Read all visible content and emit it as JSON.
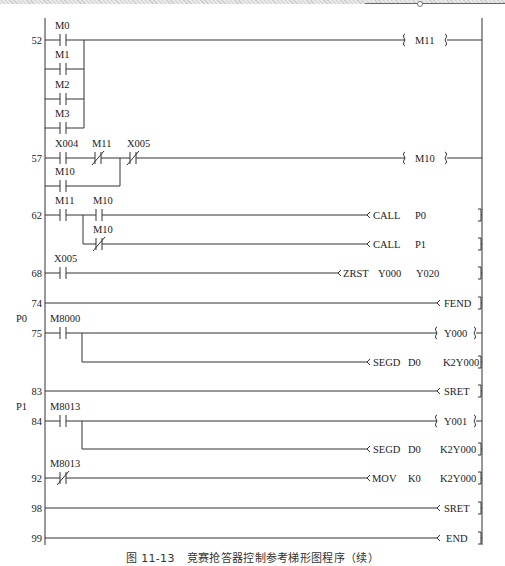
{
  "figure": {
    "caption_number": "图 11-13",
    "caption_title": "竞赛抢答器控制参考梯形图程序（续）"
  },
  "rungs": [
    {
      "step": "52",
      "contacts": [
        {
          "name": "M0",
          "type": "NO"
        },
        {
          "name": "M1",
          "type": "NO",
          "parallel": true
        },
        {
          "name": "M2",
          "type": "NO",
          "parallel": true
        },
        {
          "name": "M3",
          "type": "NO",
          "parallel": true
        }
      ],
      "output": {
        "kind": "coil",
        "text": "M11"
      }
    },
    {
      "step": "57",
      "contacts": [
        {
          "name": "X004",
          "type": "NO"
        },
        {
          "name": "M11",
          "type": "NC"
        },
        {
          "name": "X005",
          "type": "NC"
        },
        {
          "name": "M10",
          "type": "NO",
          "parallel": true
        }
      ],
      "output": {
        "kind": "coil",
        "text": "M10"
      }
    },
    {
      "step": "62",
      "contacts": [
        {
          "name": "M11",
          "type": "NO"
        },
        {
          "name": "M10",
          "type": "NO"
        },
        {
          "name": "M10",
          "type": "NC",
          "branch": true
        }
      ],
      "outputs": [
        {
          "kind": "instr",
          "op": "CALL",
          "args": [
            "P0"
          ]
        },
        {
          "kind": "instr",
          "op": "CALL",
          "args": [
            "P1"
          ]
        }
      ]
    },
    {
      "step": "68",
      "contacts": [
        {
          "name": "X005",
          "type": "NO"
        }
      ],
      "output": {
        "kind": "instr",
        "op": "ZRST",
        "args": [
          "Y000",
          "Y020"
        ]
      }
    },
    {
      "step": "74",
      "contacts": [],
      "output": {
        "kind": "instr",
        "op": "FEND",
        "args": []
      }
    },
    {
      "step": "75",
      "pointer": "P0",
      "contacts": [
        {
          "name": "M8000",
          "type": "NO"
        }
      ],
      "outputs": [
        {
          "kind": "coil",
          "text": "Y000"
        },
        {
          "kind": "instr",
          "op": "SEGD",
          "args": [
            "D0",
            "K2Y000"
          ]
        }
      ]
    },
    {
      "step": "83",
      "contacts": [],
      "output": {
        "kind": "instr",
        "op": "SRET",
        "args": []
      }
    },
    {
      "step": "84",
      "pointer": "P1",
      "contacts": [
        {
          "name": "M8013",
          "type": "NO"
        }
      ],
      "outputs": [
        {
          "kind": "coil",
          "text": "Y001"
        },
        {
          "kind": "instr",
          "op": "SEGD",
          "args": [
            "D0",
            "K2Y000"
          ]
        }
      ]
    },
    {
      "step": "92",
      "contacts": [
        {
          "name": "M8013",
          "type": "NC"
        }
      ],
      "output": {
        "kind": "instr",
        "op": "MOV",
        "args": [
          "K0",
          "K2Y000"
        ]
      }
    },
    {
      "step": "98",
      "contacts": [],
      "output": {
        "kind": "instr",
        "op": "SRET",
        "args": []
      }
    },
    {
      "step": "99",
      "contacts": [],
      "output": {
        "kind": "instr",
        "op": "END",
        "args": []
      }
    }
  ],
  "labels": {
    "s52": "52",
    "s57": "57",
    "s62": "62",
    "s68": "68",
    "s74": "74",
    "s75": "75",
    "s83": "83",
    "s84": "84",
    "s92": "92",
    "s98": "98",
    "s99": "99",
    "p0": "P0",
    "p1": "P1",
    "c_m0": "M0",
    "c_m1": "M1",
    "c_m2": "M2",
    "c_m3": "M3",
    "c_x004": "X004",
    "c_m11a": "M11",
    "c_x005a": "X005",
    "c_m10a": "M10",
    "c_m11b": "M11",
    "c_m10b": "M10",
    "c_m10c": "M10",
    "c_x005b": "X005",
    "c_m8000": "M8000",
    "c_m8013a": "M8013",
    "c_m8013b": "M8013",
    "o_m11": "M11",
    "o_m10": "M10",
    "o_call": "CALL",
    "o_p0": "P0",
    "o_call2": "CALL",
    "o_p1": "P1",
    "o_zrst": "ZRST",
    "o_y000a": "Y000",
    "o_y020": "Y020",
    "o_fend": "FEND",
    "o_y000": "Y000",
    "o_segd1": "SEGD",
    "o_d0a": "D0",
    "o_k2y1": "K2Y000",
    "o_sret1": "SRET",
    "o_y001": "Y001",
    "o_segd2": "SEGD",
    "o_d0b": "D0",
    "o_k2y2": "K2Y000",
    "o_mov": "MOV",
    "o_k0": "K0",
    "o_k2y3": "K2Y000",
    "o_sret2": "SRET",
    "o_end": "END"
  }
}
